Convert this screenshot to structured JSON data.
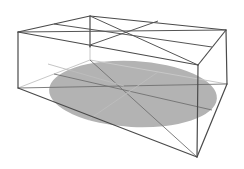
{
  "figure": {
    "colors": {
      "background": "#ffffff",
      "edge": "#4a4a4a",
      "ellipse_fill": "#b3b3b3",
      "faint_line": "#c8c8c8"
    },
    "vertices": {
      "top_front_left": [
        18,
        32
      ],
      "top_back_left": [
        90,
        16
      ],
      "top_back_right": [
        226,
        30
      ],
      "top_front_right": [
        198,
        65
      ],
      "bottom_front_left": [
        18,
        88
      ],
      "bottom_back_left": [
        90,
        60
      ],
      "bottom_back_right": [
        227,
        84
      ],
      "bottom_front_right": [
        197,
        157
      ]
    },
    "top_center": [
      125,
      32
    ],
    "bottom_center": [
      124,
      86
    ],
    "ellipse": {
      "cx": 133,
      "cy": 94,
      "rx": 84,
      "ry": 33
    }
  }
}
